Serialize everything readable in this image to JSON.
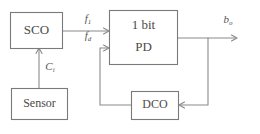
{
  "diagram": {
    "blocks": [
      {
        "id": "sco",
        "label": "SCO"
      },
      {
        "id": "sensor",
        "label": "Sensor"
      },
      {
        "id": "pd",
        "label_line1": "1 bit",
        "label_line2": "PD"
      },
      {
        "id": "dco",
        "label": "DCO"
      }
    ],
    "signals": [
      {
        "id": "f1",
        "base": "f",
        "sub": "1",
        "from": "sco",
        "to": "pd"
      },
      {
        "id": "fd",
        "base": "f",
        "sub": "d",
        "from": "dco",
        "to": "pd"
      },
      {
        "id": "c",
        "base": "C",
        "sub": "i",
        "from": "sensor",
        "to": "sco"
      },
      {
        "id": "bo",
        "base": "b",
        "sub": "o",
        "from": "pd",
        "to": "output"
      }
    ],
    "colors": {
      "background": "#ffffff",
      "box_stroke": "#7a7a7a",
      "wire": "#8a8a8a",
      "text": "#4a4a4a"
    }
  }
}
